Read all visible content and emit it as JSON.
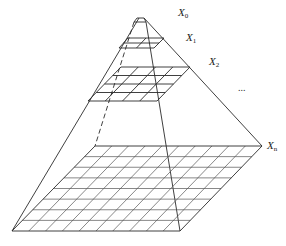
{
  "figure": {
    "type": "image-pyramid",
    "labels": [
      {
        "id": "x0",
        "base": "X",
        "sub": "0",
        "x": 178,
        "y": 7
      },
      {
        "id": "x1",
        "base": "X",
        "sub": "1",
        "x": 186,
        "y": 32
      },
      {
        "id": "x2",
        "base": "X",
        "sub": "2",
        "x": 209,
        "y": 56
      },
      {
        "id": "xn",
        "base": "X",
        "sub": "n",
        "x": 267,
        "y": 140
      }
    ],
    "ellipsis": {
      "text": "...",
      "x": 238,
      "y": 82
    },
    "colors": {
      "stroke": "#2a2a2a",
      "grid": "#555555"
    }
  }
}
